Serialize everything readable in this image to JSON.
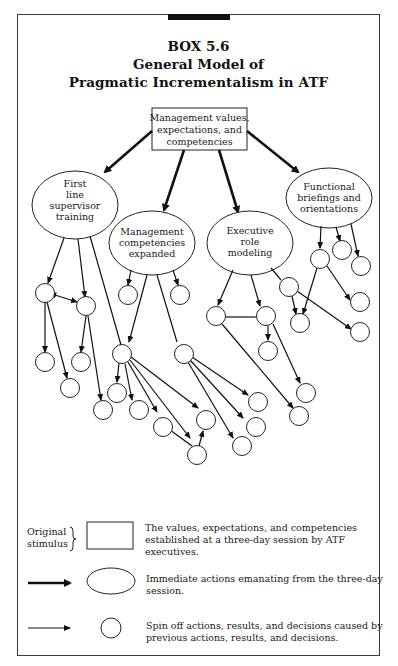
{
  "box": {
    "label": "BOX 5.6",
    "title_line1": "General Model of",
    "title_line2": "Pragmatic Incrementalism in ATF"
  },
  "root": {
    "lines": [
      "Management values,",
      "expectations, and",
      "competencies"
    ]
  },
  "immediate_actions": [
    {
      "id": "first-line-supervisor-training",
      "lines": [
        "First",
        "line",
        "supervisor",
        "training"
      ]
    },
    {
      "id": "management-competencies-expanded",
      "lines": [
        "Management",
        "competencies",
        "expanded"
      ]
    },
    {
      "id": "executive-role-modeling",
      "lines": [
        "Executive",
        "role",
        "modeling"
      ]
    },
    {
      "id": "functional-briefings-and-orientations",
      "lines": [
        "Functional",
        "briefings and",
        "orientations"
      ]
    }
  ],
  "spin_off_node_count": 36,
  "legend": {
    "stimulus_label_line1": "Original",
    "stimulus_label_line2": "stimulus",
    "stimulus_desc_line1": "The values, expectations, and competencies",
    "stimulus_desc_line2": "established at a three-day session by ATF executives.",
    "immediate_desc_line1": "Immediate actions emanating from the three-day",
    "immediate_desc_line2": "session.",
    "spinoff_desc_line1": "Spin off actions, results, and decisions caused by",
    "spinoff_desc_line2": "previous actions, results, and decisions."
  },
  "colors": {
    "ink": "#1a1a1a",
    "background": "#ffffff"
  }
}
